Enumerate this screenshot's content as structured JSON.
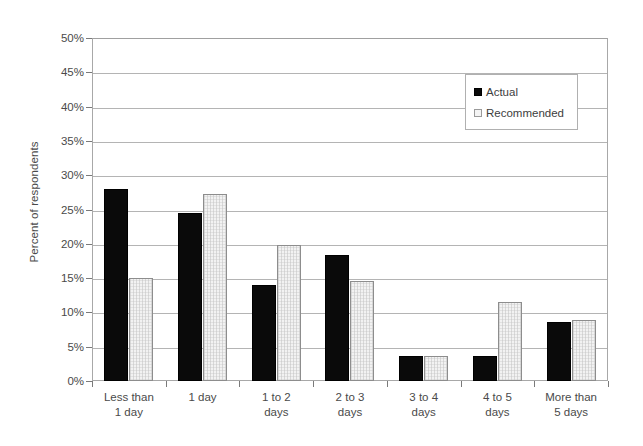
{
  "chart_data": {
    "type": "bar",
    "title": "",
    "xlabel": "",
    "ylabel": "Percent of respondents",
    "ylim": [
      0,
      50
    ],
    "y_tick_values": [
      0,
      5,
      10,
      15,
      20,
      25,
      30,
      35,
      40,
      45,
      50
    ],
    "y_tick_labels": [
      "0%",
      "5%",
      "10%",
      "15%",
      "20%",
      "25%",
      "30%",
      "35%",
      "40%",
      "45%",
      "50%"
    ],
    "grid": true,
    "legend_position": "upper right",
    "categories": [
      "Less than 1 day",
      "1 day",
      "1 to 2 days",
      "2 to 3 days",
      "3 to 4 days",
      "4 to 5 days",
      "More than 5 days"
    ],
    "category_lines": [
      [
        "Less than",
        "1 day"
      ],
      [
        "1 day",
        ""
      ],
      [
        "1 to 2",
        "days"
      ],
      [
        "2 to 3",
        "days"
      ],
      [
        "3 to 4",
        "days"
      ],
      [
        "4 to 5",
        "days"
      ],
      [
        "More than",
        "5 days"
      ]
    ],
    "series": [
      {
        "name": "Actual",
        "color": "#0a0a0a",
        "values": [
          28.0,
          24.5,
          14.0,
          18.3,
          3.6,
          3.6,
          8.6
        ]
      },
      {
        "name": "Recommended",
        "color": "#f2f2f2",
        "values": [
          15.0,
          27.2,
          19.9,
          14.6,
          3.6,
          11.5,
          8.9
        ]
      }
    ]
  },
  "legend": {
    "items": [
      {
        "label": "Actual",
        "swatch": "actual"
      },
      {
        "label": "Recommended",
        "swatch": "recommended"
      }
    ]
  },
  "axis": {
    "y_title": "Percent of respondents"
  }
}
